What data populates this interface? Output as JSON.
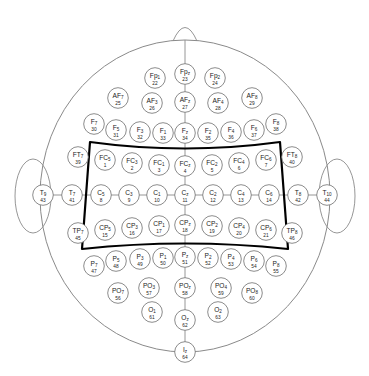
{
  "figure": {
    "kind": "eeg-electrode-montage",
    "system": "10-10 extended international system",
    "head_outline_color": "#8a8a8a",
    "electrode_stroke_color": "#777777",
    "electrode_fill_color": "#ffffff",
    "highlight_color": "#000000",
    "label_color": "#222222",
    "midline_color": "#8a8a8a",
    "background": "#ffffff"
  },
  "highlight_region": {
    "name": "sensorimotor-region",
    "covers_rows": [
      "FC",
      "C",
      "CP"
    ],
    "stroke_width": 2.2
  },
  "rows": [
    {
      "name": "Fp",
      "electrodes": [
        {
          "label": "Fp",
          "sub": "1",
          "num": "22",
          "cx": 155,
          "cy": 78
        },
        {
          "label": "Fp",
          "sub": "z",
          "num": "23",
          "cx": 185,
          "cy": 74
        },
        {
          "label": "Fp",
          "sub": "2",
          "num": "24",
          "cx": 215,
          "cy": 78
        }
      ]
    },
    {
      "name": "AF",
      "electrodes": [
        {
          "label": "AF",
          "sub": "7",
          "num": "25",
          "cx": 118,
          "cy": 98
        },
        {
          "label": "AF",
          "sub": "3",
          "num": "26",
          "cx": 152,
          "cy": 103
        },
        {
          "label": "AF",
          "sub": "z",
          "num": "27",
          "cx": 185,
          "cy": 102
        },
        {
          "label": "AF",
          "sub": "4",
          "num": "28",
          "cx": 218,
          "cy": 103
        },
        {
          "label": "AF",
          "sub": "8",
          "num": "29",
          "cx": 252,
          "cy": 98
        }
      ]
    },
    {
      "name": "F",
      "electrodes": [
        {
          "label": "F",
          "sub": "7",
          "num": "30",
          "cx": 94,
          "cy": 124
        },
        {
          "label": "F",
          "sub": "5",
          "num": "31",
          "cx": 116,
          "cy": 130
        },
        {
          "label": "F",
          "sub": "3",
          "num": "32",
          "cx": 140,
          "cy": 132
        },
        {
          "label": "F",
          "sub": "1",
          "num": "33",
          "cx": 163,
          "cy": 133
        },
        {
          "label": "F",
          "sub": "z",
          "num": "34",
          "cx": 185,
          "cy": 133
        },
        {
          "label": "F",
          "sub": "2",
          "num": "35",
          "cx": 208,
          "cy": 133
        },
        {
          "label": "F",
          "sub": "4",
          "num": "36",
          "cx": 231,
          "cy": 132
        },
        {
          "label": "F",
          "sub": "6",
          "num": "37",
          "cx": 254,
          "cy": 130
        },
        {
          "label": "F",
          "sub": "8",
          "num": "38",
          "cx": 276,
          "cy": 124
        }
      ]
    },
    {
      "name": "FT-FC",
      "electrodes": [
        {
          "label": "FT",
          "sub": "7",
          "num": "39",
          "cx": 78,
          "cy": 157
        },
        {
          "label": "FC",
          "sub": "5",
          "num": "1",
          "cx": 105,
          "cy": 160
        },
        {
          "label": "FC",
          "sub": "3",
          "num": "2",
          "cx": 132,
          "cy": 163
        },
        {
          "label": "FC",
          "sub": "1",
          "num": "3",
          "cx": 159,
          "cy": 165
        },
        {
          "label": "FC",
          "sub": "z",
          "num": "4",
          "cx": 185,
          "cy": 166
        },
        {
          "label": "FC",
          "sub": "2",
          "num": "5",
          "cx": 212,
          "cy": 165
        },
        {
          "label": "FC",
          "sub": "4",
          "num": "6",
          "cx": 239,
          "cy": 163
        },
        {
          "label": "FC",
          "sub": "6",
          "num": "7",
          "cx": 266,
          "cy": 160
        },
        {
          "label": "FT",
          "sub": "8",
          "num": "40",
          "cx": 292,
          "cy": 157
        }
      ]
    },
    {
      "name": "T-C",
      "electrodes": [
        {
          "label": "T",
          "sub": "9",
          "num": "43",
          "cx": 43,
          "cy": 195
        },
        {
          "label": "T",
          "sub": "7",
          "num": "41",
          "cx": 72,
          "cy": 195
        },
        {
          "label": "C",
          "sub": "5",
          "num": "8",
          "cx": 101,
          "cy": 195
        },
        {
          "label": "C",
          "sub": "3",
          "num": "9",
          "cx": 129,
          "cy": 195
        },
        {
          "label": "C",
          "sub": "1",
          "num": "10",
          "cx": 157,
          "cy": 195
        },
        {
          "label": "C",
          "sub": "z",
          "num": "11",
          "cx": 185,
          "cy": 195
        },
        {
          "label": "C",
          "sub": "2",
          "num": "12",
          "cx": 213,
          "cy": 195
        },
        {
          "label": "C",
          "sub": "4",
          "num": "13",
          "cx": 241,
          "cy": 195
        },
        {
          "label": "C",
          "sub": "6",
          "num": "14",
          "cx": 269,
          "cy": 195
        },
        {
          "label": "T",
          "sub": "8",
          "num": "42",
          "cx": 298,
          "cy": 195
        },
        {
          "label": "T",
          "sub": "10",
          "num": "44",
          "cx": 327,
          "cy": 195
        }
      ]
    },
    {
      "name": "TP-CP",
      "electrodes": [
        {
          "label": "TP",
          "sub": "7",
          "num": "45",
          "cx": 78,
          "cy": 233
        },
        {
          "label": "CP",
          "sub": "5",
          "num": "15",
          "cx": 105,
          "cy": 230
        },
        {
          "label": "CP",
          "sub": "3",
          "num": "16",
          "cx": 132,
          "cy": 228
        },
        {
          "label": "CP",
          "sub": "1",
          "num": "17",
          "cx": 159,
          "cy": 226
        },
        {
          "label": "CP",
          "sub": "z",
          "num": "18",
          "cx": 185,
          "cy": 225
        },
        {
          "label": "CP",
          "sub": "2",
          "num": "19",
          "cx": 212,
          "cy": 226
        },
        {
          "label": "CP",
          "sub": "4",
          "num": "20",
          "cx": 239,
          "cy": 228
        },
        {
          "label": "CP",
          "sub": "6",
          "num": "21",
          "cx": 266,
          "cy": 230
        },
        {
          "label": "TP",
          "sub": "8",
          "num": "46",
          "cx": 292,
          "cy": 233
        }
      ]
    },
    {
      "name": "P",
      "electrodes": [
        {
          "label": "P",
          "sub": "7",
          "num": "47",
          "cx": 94,
          "cy": 266
        },
        {
          "label": "P",
          "sub": "5",
          "num": "48",
          "cx": 116,
          "cy": 261
        },
        {
          "label": "P",
          "sub": "3",
          "num": "49",
          "cx": 140,
          "cy": 259
        },
        {
          "label": "P",
          "sub": "1",
          "num": "50",
          "cx": 163,
          "cy": 258
        },
        {
          "label": "P",
          "sub": "z",
          "num": "51",
          "cx": 185,
          "cy": 257
        },
        {
          "label": "P",
          "sub": "2",
          "num": "52",
          "cx": 208,
          "cy": 258
        },
        {
          "label": "P",
          "sub": "4",
          "num": "53",
          "cx": 231,
          "cy": 259
        },
        {
          "label": "P",
          "sub": "6",
          "num": "54",
          "cx": 254,
          "cy": 261
        },
        {
          "label": "P",
          "sub": "8",
          "num": "55",
          "cx": 276,
          "cy": 266
        }
      ]
    },
    {
      "name": "PO",
      "electrodes": [
        {
          "label": "PO",
          "sub": "7",
          "num": "56",
          "cx": 118,
          "cy": 293
        },
        {
          "label": "PO",
          "sub": "3",
          "num": "57",
          "cx": 149,
          "cy": 288
        },
        {
          "label": "PO",
          "sub": "z",
          "num": "58",
          "cx": 185,
          "cy": 288
        },
        {
          "label": "PO",
          "sub": "4",
          "num": "59",
          "cx": 221,
          "cy": 288
        },
        {
          "label": "PO",
          "sub": "8",
          "num": "60",
          "cx": 252,
          "cy": 293
        }
      ]
    },
    {
      "name": "O",
      "electrodes": [
        {
          "label": "O",
          "sub": "1",
          "num": "61",
          "cx": 152,
          "cy": 312
        },
        {
          "label": "O",
          "sub": "z",
          "num": "62",
          "cx": 185,
          "cy": 320
        },
        {
          "label": "O",
          "sub": "2",
          "num": "63",
          "cx": 218,
          "cy": 312
        }
      ]
    },
    {
      "name": "I",
      "electrodes": [
        {
          "label": "I",
          "sub": "z",
          "num": "64",
          "cx": 185,
          "cy": 352
        }
      ]
    }
  ]
}
